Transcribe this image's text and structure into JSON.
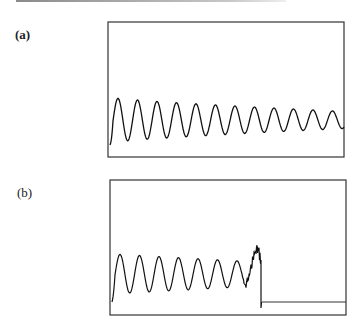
{
  "figure": {
    "panels": [
      {
        "label": "(a)"
      },
      {
        "label": "(b)"
      }
    ]
  },
  "chart_data": [
    {
      "type": "line",
      "panel": "(a)",
      "title": "",
      "xlabel": "",
      "ylabel": "",
      "axes_ticks": false,
      "grid": false,
      "description": "Decaying sinusoidal oscillation, ~12 cycles across the frame",
      "frame_px": {
        "x0": 108,
        "y0": 22,
        "x1": 344,
        "y1": 157
      },
      "signal": {
        "start_px": [
          110,
          145
        ],
        "center_y_px": 120,
        "period_px": 19.5,
        "first_peak_px": [
          118,
          97
        ],
        "first_trough_y_px": 142,
        "end_peak_y_px": 110,
        "end_trough_y_px": 127,
        "end_x_px": 344
      }
    },
    {
      "type": "line",
      "panel": "(b)",
      "title": "",
      "xlabel": "",
      "ylabel": "",
      "axes_ticks": false,
      "grid": false,
      "description": "Decaying oscillation (~7 cycles) turning into a noisy burst, then abrupt drop to a constant flat level",
      "frame_px": {
        "x0": 110,
        "y0": 180,
        "x1": 346,
        "y1": 315
      },
      "signal": {
        "start_px": [
          112,
          302
        ],
        "center_y_px": 274,
        "period_px": 19.5,
        "first_peak_px": [
          120,
          255
        ],
        "first_trough_y_px": 295,
        "burst_start_x_px": 240,
        "burst_peak_px": [
          255,
          251
        ],
        "drop_px": [
          261,
          308
        ],
        "flat_y_px": 302,
        "flat_x_range_px": [
          262,
          346
        ]
      }
    }
  ]
}
